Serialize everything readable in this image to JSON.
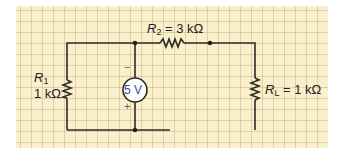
{
  "diagram": {
    "type": "circuit-schematic",
    "background_color": "#fbf0cc",
    "wire_color": "#2b2b24",
    "highlight_wire_color": "#c8281e",
    "source_text_color": "#3b4d9a",
    "components": {
      "r1": {
        "name": "R",
        "subscript": "1",
        "value": "1 kΩ"
      },
      "r2": {
        "name": "R",
        "subscript": "2",
        "equals": "=",
        "value": "3 kΩ"
      },
      "rl": {
        "name": "R",
        "subscript": "L",
        "equals": "=",
        "value": "1 kΩ"
      },
      "source": {
        "value": "5 V",
        "minus": "−",
        "plus": "+"
      }
    }
  }
}
